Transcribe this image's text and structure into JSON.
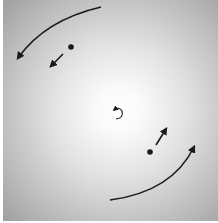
{
  "diagram": {
    "colors": {
      "background_center": "#ffffff",
      "background_edge": "#9f9f9f",
      "ink": "#1a1a1a"
    },
    "elements": {
      "outer_arrow_top": {
        "direction": "counterclockwise",
        "from": [
          101,
          7
        ],
        "to": [
          17,
          60
        ]
      },
      "outer_arrow_bottom": {
        "direction": "counterclockwise",
        "from": [
          110,
          200
        ],
        "to": [
          195,
          145
        ]
      },
      "particle_upper_left": {
        "position": [
          71,
          47
        ],
        "velocity_arrow": {
          "from": [
            63,
            54
          ],
          "to": [
            50,
            68
          ]
        }
      },
      "particle_lower_right": {
        "position": [
          150,
          152
        ],
        "velocity_arrow": {
          "from": [
            156,
            145
          ],
          "to": [
            167,
            128
          ]
        }
      },
      "center_rotation_arrow": {
        "position": [
          118,
          113
        ],
        "radius": 5,
        "direction": "counterclockwise"
      }
    }
  }
}
